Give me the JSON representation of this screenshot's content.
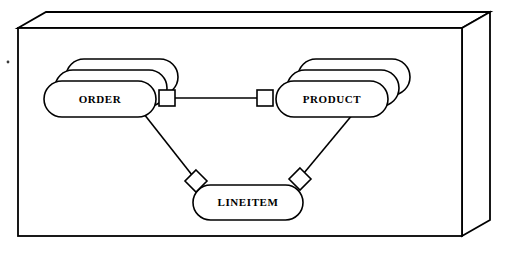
{
  "diagram": {
    "notation": "stacked rounded rectangles denote multi-instance entities",
    "background_color": "#ffffff",
    "stroke_color": "#000000",
    "fill_color": "#ffffff"
  },
  "frame": {
    "name": "3d-slab-container",
    "style": "isometric box with visible top and right faces",
    "front": {
      "x": 18,
      "y": 28,
      "width": 444,
      "height": 208
    },
    "depth_x": 28,
    "depth_y": 16
  },
  "entities": [
    {
      "id": "order",
      "label": "ORDER",
      "shape": "stacked-rounded-rectangle",
      "stack_count": 3,
      "stack_offset_x": 11,
      "stack_offset_y": -11,
      "x": 44,
      "y": 81,
      "width": 112,
      "height": 36,
      "label_cx": 100,
      "label_cy": 99
    },
    {
      "id": "product",
      "label": "PRODUCT",
      "shape": "stacked-rounded-rectangle",
      "stack_count": 3,
      "stack_offset_x": 11,
      "stack_offset_y": -11,
      "x": 276,
      "y": 81,
      "width": 112,
      "height": 36,
      "label_cx": 332,
      "label_cy": 99
    },
    {
      "id": "lineitem",
      "label": "LINEITEM",
      "shape": "rounded-rectangle",
      "stack_count": 1,
      "stack_offset_x": 0,
      "stack_offset_y": 0,
      "x": 193,
      "y": 185,
      "width": 110,
      "height": 35,
      "label_cx": 248,
      "label_cy": 202
    }
  ],
  "connectors": [
    {
      "id": "order-side-square",
      "type": "square",
      "on_entity": "order",
      "cx": 167,
      "cy": 98,
      "size": 15
    },
    {
      "id": "product-side-square",
      "type": "square",
      "on_entity": "product",
      "cx": 265,
      "cy": 98,
      "size": 15
    },
    {
      "id": "lineitem-left-diamond",
      "type": "diamond",
      "on_entity": "lineitem",
      "cx": 196,
      "cy": 181,
      "size": 15
    },
    {
      "id": "lineitem-right-diamond",
      "type": "diamond",
      "on_entity": "lineitem",
      "cx": 300,
      "cy": 179,
      "size": 15
    }
  ],
  "relationships": [
    {
      "id": "order-product",
      "from": "order",
      "to": "product",
      "path": "M175,98 L257,98",
      "style": "horizontal"
    },
    {
      "id": "order-lineitem",
      "from": "order",
      "to": "lineitem",
      "path": "M144,115 L191,174",
      "style": "diagonal"
    },
    {
      "id": "product-lineitem",
      "from": "product",
      "to": "lineitem",
      "path": "M352,115 L305,172",
      "style": "diagonal"
    }
  ],
  "artifacts": [
    {
      "id": "scan-speck",
      "cx": 8,
      "cy": 62,
      "r": 1.4
    }
  ]
}
